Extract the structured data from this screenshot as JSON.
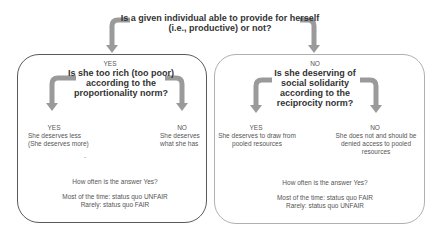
{
  "root_question": {
    "line1": "Is a given individual able to provide for herself",
    "line2": "(i.e., productive) or not?"
  },
  "left_branch": {
    "answer_label": "YES",
    "question": [
      "Is she too rich (too poor)",
      "according to the",
      "proportionality norm?"
    ],
    "yes": {
      "label": "YES",
      "text": [
        "She deserves less",
        "(She deserves more)"
      ]
    },
    "no": {
      "label": "NO",
      "text": [
        "She deserves",
        "what she has"
      ]
    },
    "dash": "-",
    "frequency_question": "How often is the answer Yes?",
    "outcomes": [
      "Most of the time: status quo UNFAIR",
      "Rarely: status quo FAIR"
    ]
  },
  "right_branch": {
    "answer_label": "NO",
    "question": [
      "Is she deserving of",
      "social solidarity",
      "according to the",
      "reciprocity norm?"
    ],
    "yes": {
      "label": "YES",
      "text": [
        "She deserves to draw from",
        "pooled resources"
      ]
    },
    "no": {
      "label": "NO",
      "text": [
        "She does not and should be",
        "denied access to pooled",
        "resources"
      ]
    },
    "frequency_question": "How often is the answer Yes?",
    "outcomes": [
      "Most of the time: status quo FAIR",
      "Rarely: status quo UNFAIR"
    ]
  },
  "colors": {
    "arrow": "#999999",
    "left_border": "#5a5a5a",
    "right_border": "#b0b0b0"
  }
}
